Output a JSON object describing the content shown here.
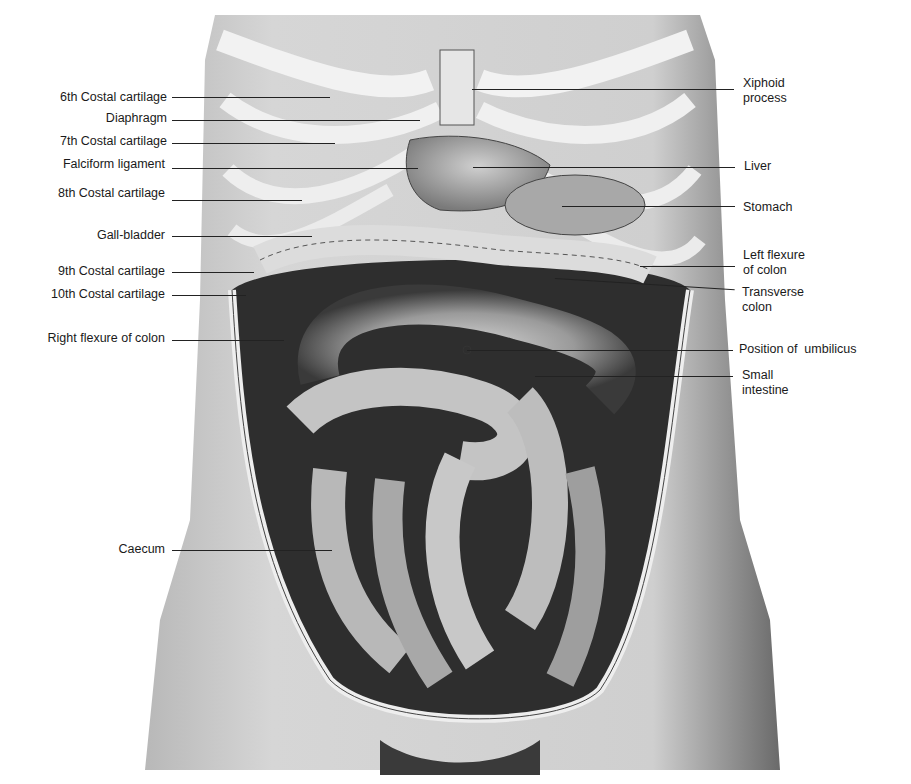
{
  "figure": {
    "labels_left": [
      {
        "id": "sixth-costal-cartilage",
        "text": "6th Costal cartilage",
        "y": 97,
        "x_end": 330
      },
      {
        "id": "diaphragm",
        "text": "Diaphragm",
        "y": 118,
        "x_end": 420
      },
      {
        "id": "seventh-costal-cartilage",
        "text": "7th Costal cartilage",
        "y": 141,
        "x_end": 335
      },
      {
        "id": "falciform-ligament",
        "text": "Falciform ligament",
        "y": 164,
        "x_end": 418
      },
      {
        "id": "eighth-costal-cartilage",
        "text": "8th Costal cartilage",
        "y": 195,
        "x_end": 302
      },
      {
        "id": "gall-bladder",
        "text": "Gall-bladder",
        "y": 235,
        "x_end": 312
      },
      {
        "id": "ninth-costal-cartilage",
        "text": "9th Costal cartilage",
        "y": 271,
        "x_end": 254
      },
      {
        "id": "tenth-costal-cartilage",
        "text": "10th Costal cartilage",
        "y": 294,
        "x_end": 246
      },
      {
        "id": "right-flexure-of-colon",
        "text": "Right flexure of colon",
        "y": 339,
        "x_end": 284
      },
      {
        "id": "caecum",
        "text": "Caecum",
        "y": 550,
        "x_end": 332
      }
    ],
    "labels_right": [
      {
        "id": "xiphoid-process",
        "lines": [
          "Xiphoid",
          "process"
        ],
        "y": 86,
        "x_start": 472
      },
      {
        "id": "liver",
        "lines": [
          "Liver"
        ],
        "y": 166,
        "x_start": 473
      },
      {
        "id": "stomach",
        "lines": [
          "Stomach"
        ],
        "y": 207,
        "x_start": 562
      },
      {
        "id": "left-flexure-of-colon",
        "lines": [
          "Left flexure",
          "of colon"
        ],
        "y": 262,
        "x_start": 640
      },
      {
        "id": "transverse-colon",
        "lines": [
          "Transverse",
          "colon"
        ],
        "y": 292,
        "x_start": 555
      },
      {
        "id": "position-of-umbilicus",
        "lines": [
          "Position of  umbilicus"
        ],
        "y": 350,
        "x_start": 467
      },
      {
        "id": "small-intestine",
        "lines": [
          "Small",
          "intestine"
        ],
        "y": 376,
        "x_start": 535
      }
    ]
  }
}
